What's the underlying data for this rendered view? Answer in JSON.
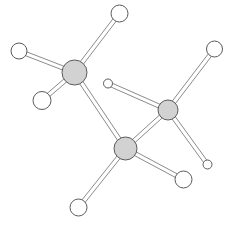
{
  "figure": {
    "type": "molecular-structure-diagram",
    "background_color": "#ffffff",
    "width": 230,
    "height": 226
  },
  "style": {
    "heavy_atom_fill": "#d2d2d2",
    "heavy_atom_stroke": "#5a5a5a",
    "light_atom_fill": "#ffffff",
    "light_atom_stroke": "#5a5a5a",
    "bond_stroke": "#8c8c8c",
    "bond_fill": "#ffffff",
    "bond_width": 4,
    "bond_stroke_width": 1,
    "atom_stroke_width": 1
  },
  "chart_data": {
    "type": "scatter",
    "xlabel": "",
    "ylabel": "",
    "xlim": [
      0,
      230
    ],
    "ylim": [
      0,
      226
    ],
    "grid": false,
    "legend": "none",
    "atoms": [
      {
        "id": "A1",
        "kind": "heavy",
        "x": 74.5,
        "y": 72.5,
        "r": 12.5
      },
      {
        "id": "A2",
        "kind": "heavy",
        "x": 125.5,
        "y": 148.5,
        "r": 11.5
      },
      {
        "id": "A3",
        "kind": "heavy",
        "x": 168.0,
        "y": 110.0,
        "r": 10.0
      },
      {
        "id": "B1",
        "kind": "light",
        "x": 119.5,
        "y": 13.5,
        "r": 8.5
      },
      {
        "id": "B2",
        "kind": "light",
        "x": 19.0,
        "y": 51.0,
        "r": 8.0
      },
      {
        "id": "B3",
        "kind": "light",
        "x": 42.0,
        "y": 100.5,
        "r": 9.0
      },
      {
        "id": "B4",
        "kind": "light",
        "x": 108.0,
        "y": 83.5,
        "r": 4.5
      },
      {
        "id": "B5",
        "kind": "light",
        "x": 214.5,
        "y": 49.0,
        "r": 8.0
      },
      {
        "id": "B6",
        "kind": "light",
        "x": 207.5,
        "y": 164.5,
        "r": 4.5
      },
      {
        "id": "B7",
        "kind": "light",
        "x": 183.5,
        "y": 179.5,
        "r": 8.5
      },
      {
        "id": "B8",
        "kind": "light",
        "x": 78.5,
        "y": 207.5,
        "r": 8.5
      }
    ],
    "bonds": [
      {
        "from": "A1",
        "to": "B1"
      },
      {
        "from": "A1",
        "to": "B2"
      },
      {
        "from": "A1",
        "to": "B3"
      },
      {
        "from": "A1",
        "to": "A2"
      },
      {
        "from": "A2",
        "to": "B8"
      },
      {
        "from": "A2",
        "to": "B7"
      },
      {
        "from": "A2",
        "to": "A3"
      },
      {
        "from": "A3",
        "to": "B4"
      },
      {
        "from": "A3",
        "to": "B5"
      },
      {
        "from": "A3",
        "to": "B6"
      }
    ],
    "counts": {
      "heavy_atoms": 3,
      "light_atoms": 8,
      "bonds": 10
    }
  }
}
